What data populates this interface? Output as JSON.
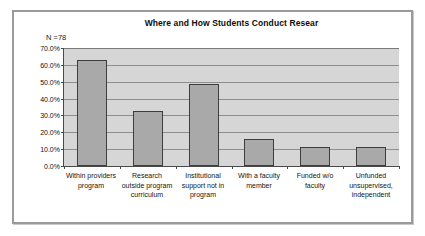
{
  "chart_data": {
    "type": "bar",
    "title": "Where and How Students Conduct Resear",
    "annotation": "N =78",
    "xlabel": "",
    "ylabel": "",
    "ylim": [
      0,
      70
    ],
    "grid": true,
    "legend": "none",
    "categories": [
      "Within providers program",
      "Research outside program curriculum",
      "Institutional support not in program",
      "With a faculty member",
      "Funded w/o faculty",
      "Unfunded unsupervised, independent"
    ],
    "category_lines": [
      [
        "Within providers",
        "program"
      ],
      [
        "Research",
        "outside program",
        "curriculum"
      ],
      [
        "Institutional",
        "support not in",
        "program"
      ],
      [
        "With a faculty",
        "member"
      ],
      [
        "Funded w/o",
        "faculty"
      ],
      [
        "Unfunded",
        "unsupervised,",
        "independent"
      ]
    ],
    "values": [
      62.8,
      32.9,
      48.7,
      16.2,
      11.2,
      11.2
    ],
    "ytick_labels": [
      "70.0%",
      "60.0%",
      "50.0%",
      "40.0%",
      "30.0%",
      "20.0%",
      "10.0%",
      "0.0%"
    ],
    "ytick_values": [
      70,
      60,
      50,
      40,
      30,
      20,
      10,
      0
    ],
    "colors": {
      "bar_fill": "#a9a9a9",
      "bar_border": "#3d3d3d",
      "plot_background": "#d6d6d6",
      "gridline": "#8e8e8e",
      "axis": "#4a4a4a",
      "frame_border": "#9a9a9a",
      "text": "#111111",
      "page_background": "#ffffff"
    }
  }
}
